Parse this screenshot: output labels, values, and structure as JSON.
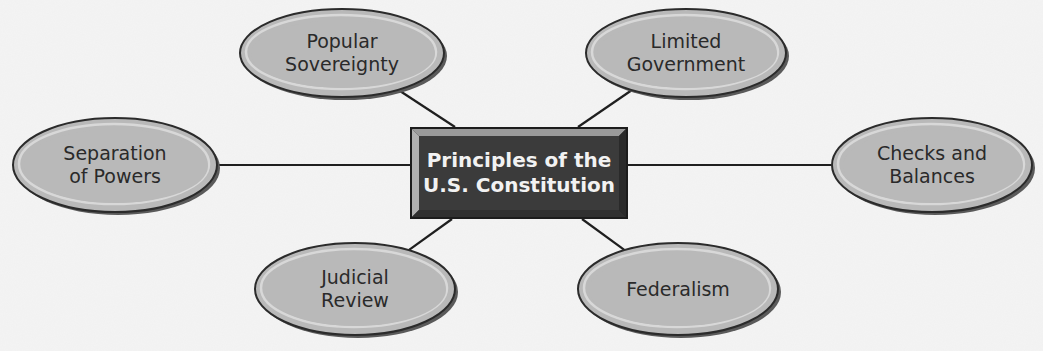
{
  "diagram": {
    "type": "concept-web",
    "center": {
      "label": "Principles of the\nU.S. Constitution",
      "x": 410,
      "y": 127,
      "w": 218,
      "h": 92
    },
    "nodes": [
      {
        "id": "popular-sovereignty",
        "label": "Popular\nSovereignty",
        "cx": 342,
        "cy": 53,
        "rx": 102,
        "ry": 44,
        "anchor": [
          455,
          127
        ]
      },
      {
        "id": "limited-government",
        "label": "Limited\nGovernment",
        "cx": 686,
        "cy": 53,
        "rx": 100,
        "ry": 44,
        "anchor": [
          578,
          127
        ]
      },
      {
        "id": "separation-of-powers",
        "label": "Separation\nof Powers",
        "cx": 115,
        "cy": 165,
        "rx": 102,
        "ry": 47,
        "anchor": [
          410,
          165
        ]
      },
      {
        "id": "checks-and-balances",
        "label": "Checks and\nBalances",
        "cx": 932,
        "cy": 165,
        "rx": 100,
        "ry": 47,
        "anchor": [
          628,
          165
        ]
      },
      {
        "id": "judicial-review",
        "label": "Judicial\nReview",
        "cx": 355,
        "cy": 289,
        "rx": 100,
        "ry": 46,
        "anchor": [
          452,
          219
        ]
      },
      {
        "id": "federalism",
        "label": "Federalism",
        "cx": 678,
        "cy": 289,
        "rx": 100,
        "ry": 46,
        "anchor": [
          582,
          219
        ]
      }
    ],
    "colors": {
      "background": "#f4f4f4",
      "node_fill": "#b9b9b9",
      "node_highlight": "#d8d8d8",
      "node_shadow": "#5a5a5a",
      "node_outline": "#2b2b2b",
      "center_fill": "#3b3b3b",
      "center_bevel_light": "#9a9a9a",
      "center_bevel_dark": "#1c1c1c",
      "connector": "#1f1f1f"
    }
  }
}
